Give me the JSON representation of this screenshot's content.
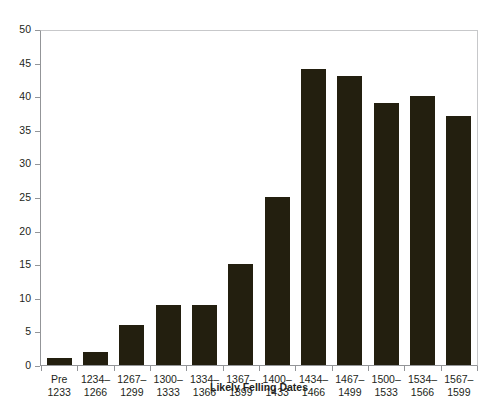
{
  "chart_data": {
    "type": "bar",
    "title": "",
    "xlabel": "Likely Felling Dates",
    "ylabel": "",
    "ylim": [
      0,
      50
    ],
    "ytick_step": 5,
    "yticks": [
      0,
      5,
      10,
      15,
      20,
      25,
      30,
      35,
      40,
      45,
      50
    ],
    "grid": false,
    "legend": false,
    "bar_color": "#231f0f",
    "axis_color": "#939598",
    "categories": [
      "Pre\n1233",
      "1234–\n1266",
      "1267–\n1299",
      "1300–\n1333",
      "1334–\n1366",
      "1367–\n1399",
      "1400–\n1433",
      "1434–\n1466",
      "1467–\n1499",
      "1500–\n1533",
      "1534–\n1566",
      "1567–\n1599"
    ],
    "values": [
      1,
      2,
      6,
      9,
      9,
      15,
      25,
      44,
      43,
      39,
      40,
      37
    ]
  }
}
